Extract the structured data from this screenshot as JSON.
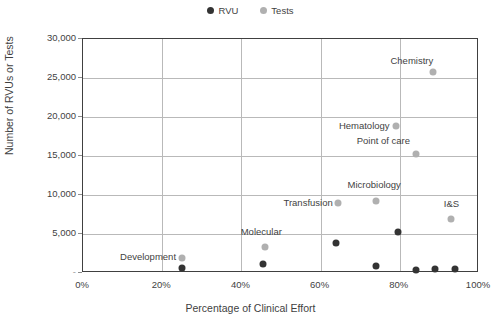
{
  "chart_data": {
    "type": "scatter",
    "title": "",
    "xlabel": "Percentage of Clinical Effort",
    "ylabel": "Number of RVUs or Tests",
    "xlim": [
      0,
      100
    ],
    "ylim": [
      0,
      30000
    ],
    "grid": true,
    "legend_position": "top-center",
    "x_ticks": [
      "0%",
      "20%",
      "40%",
      "60%",
      "80%",
      "100%"
    ],
    "x_tick_values": [
      0,
      20,
      40,
      60,
      80,
      100
    ],
    "y_ticks": [
      "-",
      "5,000",
      "10,000",
      "15,000",
      "20,000",
      "25,000",
      "30,000"
    ],
    "y_tick_values": [
      0,
      5000,
      10000,
      15000,
      20000,
      25000,
      30000
    ],
    "series": [
      {
        "name": "RVU",
        "color": "#333333",
        "points": [
          {
            "label": "Development",
            "x": 25.0,
            "y": 600
          },
          {
            "label": "Molecular",
            "x": 45.5,
            "y": 1100
          },
          {
            "label": "Transfusion",
            "x": 64.0,
            "y": 3900
          },
          {
            "label": "Microbiology",
            "x": 74.0,
            "y": 900
          },
          {
            "label": "Hematology",
            "x": 79.5,
            "y": 5200
          },
          {
            "label": "Point of care",
            "x": 84.0,
            "y": 400
          },
          {
            "label": "Chemistry",
            "x": 89.0,
            "y": 500
          },
          {
            "label": "I&S",
            "x": 94.0,
            "y": 500
          }
        ]
      },
      {
        "name": "Tests",
        "color": "#b0b0b0",
        "points": [
          {
            "label": "Development",
            "x": 25.0,
            "y": 1900
          },
          {
            "label": "Molecular",
            "x": 46.0,
            "y": 3300
          },
          {
            "label": "Transfusion",
            "x": 64.5,
            "y": 9000
          },
          {
            "label": "Microbiology",
            "x": 74.0,
            "y": 9200
          },
          {
            "label": "Hematology",
            "x": 79.0,
            "y": 18900
          },
          {
            "label": "Point of care",
            "x": 84.0,
            "y": 15300
          },
          {
            "label": "Chemistry",
            "x": 88.5,
            "y": 25800
          },
          {
            "label": "I&S",
            "x": 93.0,
            "y": 6900
          }
        ]
      }
    ],
    "point_labels": [
      {
        "text": "Chemistry",
        "x": 88.5,
        "y": 27200,
        "anchor": "end",
        "dx": 0,
        "dy": 0
      },
      {
        "text": "Hematology",
        "x": 77.5,
        "y": 18900,
        "anchor": "end",
        "dx": 0,
        "dy": 0
      },
      {
        "text": "Point of care",
        "x": 82.5,
        "y": 16900,
        "anchor": "end",
        "dx": 0,
        "dy": 0
      },
      {
        "text": "Microbiology",
        "x": 73.5,
        "y": 11300,
        "anchor": "middle",
        "dx": 0,
        "dy": 0
      },
      {
        "text": "Transfusion",
        "x": 63.0,
        "y": 9000,
        "anchor": "end",
        "dx": 0,
        "dy": 0
      },
      {
        "text": "I&S",
        "x": 93.0,
        "y": 8900,
        "anchor": "middle",
        "dx": 0,
        "dy": 0
      },
      {
        "text": "Molecular",
        "x": 45.0,
        "y": 5200,
        "anchor": "middle",
        "dx": 0,
        "dy": 0
      },
      {
        "text": "Development",
        "x": 23.5,
        "y": 2000,
        "anchor": "end",
        "dx": 0,
        "dy": 0
      }
    ]
  },
  "legend": {
    "items": [
      {
        "label": "RVU",
        "color": "#333333"
      },
      {
        "label": "Tests",
        "color": "#b0b0b0"
      }
    ]
  },
  "axes": {
    "x_title": "Percentage of Clinical Effort",
    "y_title": "Number of RVUs or Tests"
  }
}
